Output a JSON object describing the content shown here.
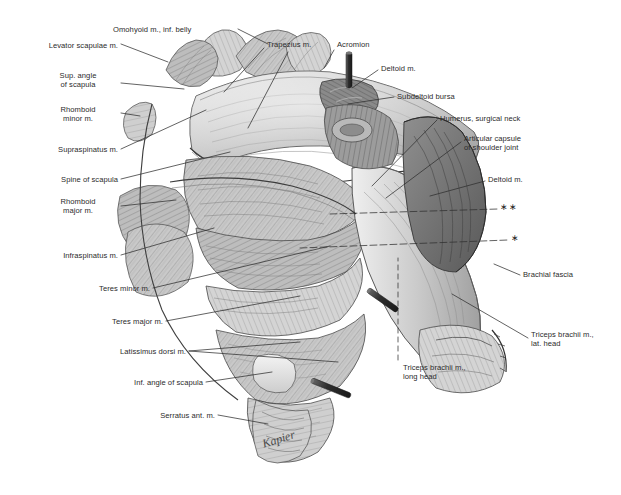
{
  "figure": {
    "background_color": "#ffffff",
    "ink_color": "#2b2b2b",
    "signature": "Kapier"
  },
  "labels": {
    "left": [
      {
        "id": "omohyoid",
        "text": "Omohyoid m., inf. belly",
        "x": 113,
        "y": 25,
        "align": "left"
      },
      {
        "id": "levator-scapulae",
        "text": "Levator scapulae m.",
        "x": 118,
        "y": 41,
        "align": "right"
      },
      {
        "id": "sup-angle",
        "text": "Sup. angle\nof scapula",
        "x": 118,
        "y": 76,
        "align": "right"
      },
      {
        "id": "rhomboid-minor",
        "text": "Rhomboid\nminor m.",
        "x": 118,
        "y": 110,
        "align": "right"
      },
      {
        "id": "supraspinatus",
        "text": "Supraspinatus m.",
        "x": 118,
        "y": 146,
        "align": "right"
      },
      {
        "id": "spine-scapula",
        "text": "Spine of scapula",
        "x": 118,
        "y": 176,
        "align": "right"
      },
      {
        "id": "rhomboid-major",
        "text": "Rhomboid\nmajor m.",
        "x": 118,
        "y": 199,
        "align": "right"
      },
      {
        "id": "infraspinatus",
        "text": "Infraspinatus m.",
        "x": 118,
        "y": 252,
        "align": "right"
      },
      {
        "id": "teres-minor",
        "text": "Teres minor m.",
        "x": 150,
        "y": 285,
        "align": "right"
      },
      {
        "id": "teres-major",
        "text": "Teres major m.",
        "x": 163,
        "y": 318,
        "align": "right"
      },
      {
        "id": "latissimus",
        "text": "Latissimus dorsi m.",
        "x": 186,
        "y": 348,
        "align": "right"
      },
      {
        "id": "inf-angle",
        "text": "Inf. angle of scapula",
        "x": 203,
        "y": 379,
        "align": "right"
      },
      {
        "id": "serratus",
        "text": "Serratus ant. m.",
        "x": 215,
        "y": 412,
        "align": "right"
      }
    ],
    "top": [
      {
        "id": "trapezius",
        "text": "Trapezius m.",
        "x": 267,
        "y": 42,
        "align": "left"
      },
      {
        "id": "acromion",
        "text": "Acromion",
        "x": 337,
        "y": 42,
        "align": "left"
      }
    ],
    "right": [
      {
        "id": "deltoid-upper",
        "text": "Deltoid m.",
        "x": 381,
        "y": 66,
        "align": "left"
      },
      {
        "id": "subdeltoid-bursa",
        "text": "Subdeltoid bursa",
        "x": 397,
        "y": 94,
        "align": "left"
      },
      {
        "id": "humerus-neck",
        "text": "Humerus, surgical neck",
        "x": 440,
        "y": 116,
        "align": "left"
      },
      {
        "id": "articular-capsule",
        "text": "Articular capsule\nof shoulder joint",
        "x": 464,
        "y": 138,
        "align": "left"
      },
      {
        "id": "deltoid-lower",
        "text": "Deltoid m.",
        "x": 488,
        "y": 177,
        "align": "left"
      },
      {
        "id": "brachial-fascia",
        "text": "Brachial fascia",
        "x": 523,
        "y": 272,
        "align": "left"
      },
      {
        "id": "triceps-lat-head",
        "text": "Triceps brachii m.,\nlat. head",
        "x": 531,
        "y": 334,
        "align": "left"
      }
    ],
    "bottom": [
      {
        "id": "triceps-long-head",
        "text": "Triceps brachii m.,\nlong head",
        "x": 403,
        "y": 366,
        "align": "left"
      }
    ],
    "markers": [
      {
        "id": "double-asterisk",
        "text": "∗∗",
        "x": 503,
        "y": 204
      },
      {
        "id": "single-asterisk",
        "text": "∗",
        "x": 513,
        "y": 235
      }
    ]
  }
}
